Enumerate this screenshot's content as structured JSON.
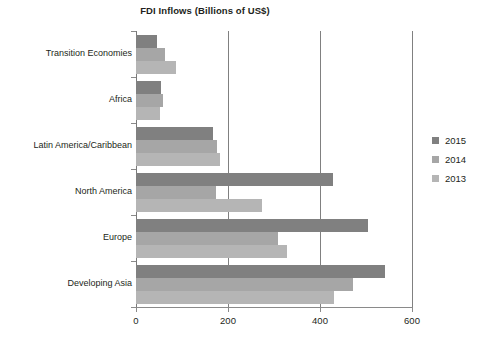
{
  "chart_data": {
    "type": "bar",
    "orientation": "horizontal",
    "title": "FDI Inflows (Billions of US$)",
    "xlabel": "",
    "ylabel": "",
    "xlim": [
      0,
      600
    ],
    "xticks": [
      0,
      200,
      400,
      600
    ],
    "xtick_labels": [
      "0",
      "200",
      "400",
      "600"
    ],
    "grid": true,
    "grid_axis": "x",
    "legend_position": "right",
    "categories": [
      "Transition Economies",
      "Africa",
      "Latin America/Caribbean",
      "North America",
      "Europe",
      "Developing Asia"
    ],
    "series": [
      {
        "name": "2015",
        "color": "#808080",
        "values": [
          45,
          54,
          168,
          429,
          504,
          541
        ]
      },
      {
        "name": "2014",
        "color": "#a6a6a6",
        "values": [
          62,
          58,
          176,
          174,
          308,
          472
        ]
      },
      {
        "name": "2013",
        "color": "#b5b5b5",
        "values": [
          88,
          52,
          182,
          274,
          329,
          431
        ]
      }
    ]
  },
  "legend": {
    "entries": [
      {
        "label": "2015",
        "color": "#808080"
      },
      {
        "label": "2014",
        "color": "#a6a6a6"
      },
      {
        "label": "2013",
        "color": "#b5b5b5"
      }
    ]
  },
  "colors": {
    "series_2015": "#808080",
    "series_2014": "#a6a6a6",
    "series_2013": "#b5b5b5",
    "axis": "#8a8a8a",
    "gridline": "#808080",
    "text": "#231f20",
    "background": "#ffffff"
  }
}
